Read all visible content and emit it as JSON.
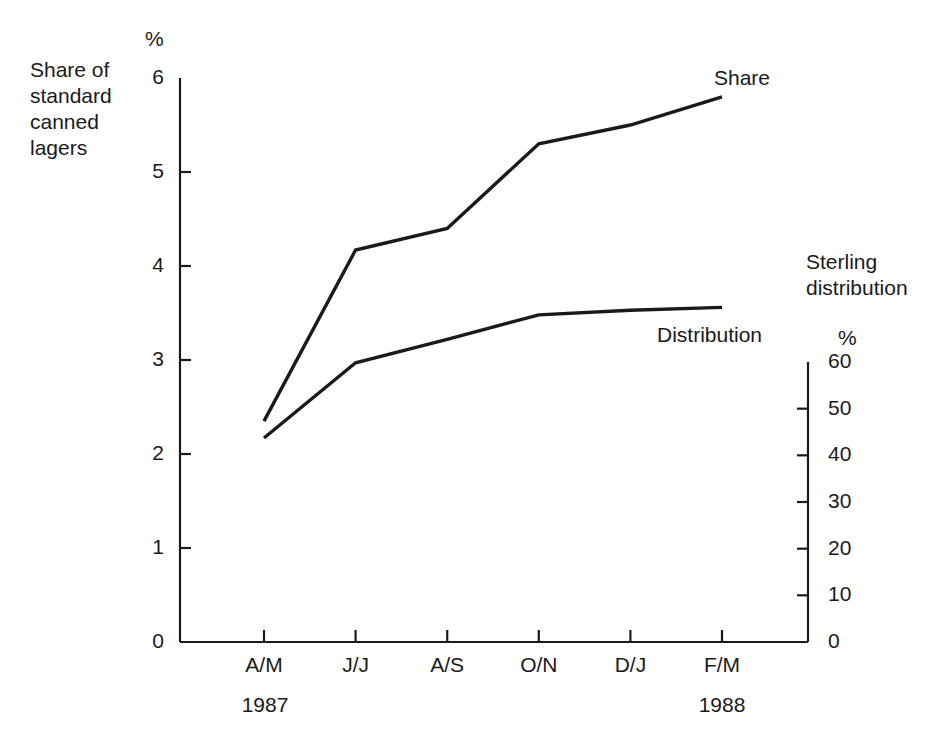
{
  "figure": {
    "background_color": "#ffffff",
    "line_color": "#1a1a1a",
    "axis_color": "#1a1a1a"
  },
  "labels": {
    "left_block": "Share of\nstandard\ncanned\nlagers",
    "right_block": "Sterling\ndistribution",
    "left_unit": "%",
    "right_unit": "%",
    "year_left": "1987",
    "year_right": "1988",
    "series_share": "Share",
    "series_distribution": "Distribution"
  },
  "chart_data": {
    "type": "line",
    "title": "",
    "subtitle": "",
    "categories": [
      "A/M",
      "J/J",
      "A/S",
      "O/N",
      "D/J",
      "F/M"
    ],
    "period_labels": [
      "1987",
      "1988"
    ],
    "xlabel": "",
    "grid": false,
    "legend": "inline-end-of-line",
    "left_axis": {
      "label": "Share of standard canned lagers",
      "unit": "%",
      "ticks": [
        0,
        1,
        2,
        3,
        4,
        5,
        6
      ],
      "tick_labels": [
        "0",
        "1",
        "2",
        "3",
        "4",
        "5",
        "6"
      ],
      "ylim": [
        0,
        6
      ]
    },
    "right_axis": {
      "label": "Sterling distribution",
      "unit": "%",
      "ticks": [
        0,
        10,
        20,
        30,
        40,
        50,
        60
      ],
      "tick_labels": [
        "0",
        "10",
        "20",
        "30",
        "40",
        "50",
        "60"
      ],
      "ylim": [
        0,
        60
      ]
    },
    "series": [
      {
        "name": "Share",
        "axis": "left",
        "unit": "%",
        "values": [
          2.35,
          4.17,
          4.4,
          5.3,
          5.5,
          5.8
        ]
      },
      {
        "name": "Distribution",
        "axis": "right",
        "unit": "%",
        "values": [
          43,
          59.5,
          64.5,
          69.5,
          70.5,
          71
        ],
        "values_in_left_axis_units": [
          2.17,
          2.97,
          3.22,
          3.48,
          3.53,
          3.56
        ]
      }
    ]
  }
}
